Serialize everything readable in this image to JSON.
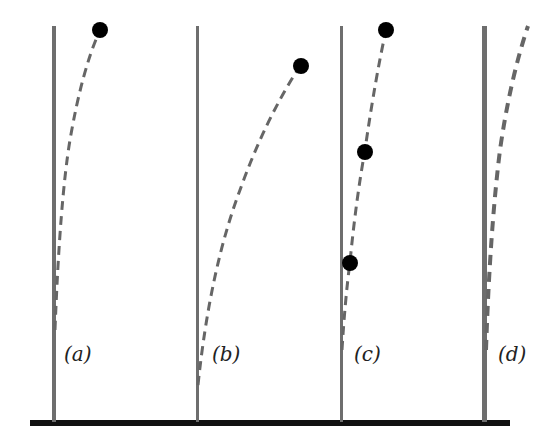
{
  "diagram": {
    "panels": [
      {
        "label": "(a)",
        "masses": 1
      },
      {
        "label": "(b)",
        "masses": 1
      },
      {
        "label": "(c)",
        "masses": 3
      },
      {
        "label": "(d)",
        "masses": 0
      }
    ],
    "colors": {
      "pole": "#6e6e6e",
      "ground": "#111111",
      "deflection": "#666666",
      "mass": "#000000"
    }
  }
}
